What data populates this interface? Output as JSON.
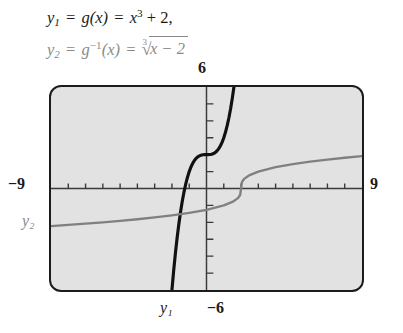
{
  "equations": {
    "line1": {
      "lhs": "y",
      "lhs_sub": "1",
      "eq1": "=",
      "fn": "g",
      "arg": "(x)",
      "eq2": "=",
      "rhs_base": "x",
      "rhs_exp": "3",
      "rhs_tail": "+ 2,",
      "plain": "y₁ = g(x) = x³ + 2,"
    },
    "line2": {
      "lhs": "y",
      "lhs_sub": "2",
      "eq1": "=",
      "fn": "g",
      "fn_exp": "−1",
      "arg": "(x)",
      "eq2": "=",
      "root_index": "3",
      "radicand": "x − 2",
      "plain": "y₂ = g⁻¹(x) = ∛(x − 2)"
    }
  },
  "screen": {
    "window_labels": {
      "ymax": "6",
      "xmin": "−9",
      "xmax": "9",
      "ymin": "−6"
    },
    "curve_labels": {
      "y1": "y₁",
      "y2": "y₂"
    },
    "colors": {
      "screen_fill": "#e2e2e2",
      "screen_border": "#1c1c1c",
      "axis": "#3a3a3a",
      "curve_y1": "#111111",
      "curve_y2": "#808080"
    }
  },
  "chart_data": {
    "type": "line",
    "title": "",
    "xlabel": "",
    "ylabel": "",
    "xlim": [
      -9,
      9
    ],
    "ylim": [
      -6,
      6
    ],
    "grid": false,
    "legend": "none",
    "axis_ticks": {
      "x": [
        -8,
        -7,
        -6,
        -5,
        -4,
        -3,
        -2,
        -1,
        1,
        2,
        3,
        4,
        5,
        6,
        7,
        8
      ],
      "y": [
        -5,
        -4,
        -3,
        -2,
        -1,
        1,
        2,
        3,
        4,
        5
      ],
      "tick_interval": 1
    },
    "annotations": [
      {
        "text": "6",
        "position": "above y-axis, top of screen"
      },
      {
        "text": "−9",
        "position": "left of screen at x-axis"
      },
      {
        "text": "9",
        "position": "right of screen at x-axis"
      },
      {
        "text": "−6",
        "position": "below y-axis, bottom of screen"
      },
      {
        "text": "y₁",
        "position": "below black curve, bottom left of center"
      },
      {
        "text": "y₂",
        "position": "left of screen, on gray curve level"
      }
    ],
    "series": [
      {
        "name": "y₁",
        "label": "y₁ = g(x) = x³ + 2",
        "expression": "x^3 + 2",
        "color": "#111111",
        "x": [
          -2.0,
          -1.9,
          -1.8,
          -1.7,
          -1.6,
          -1.5,
          -1.4,
          -1.3,
          -1.2,
          -1.1,
          -1.0,
          -0.9,
          -0.8,
          -0.7,
          -0.6,
          -0.5,
          -0.4,
          -0.3,
          -0.2,
          -0.1,
          0.0,
          0.1,
          0.2,
          0.3,
          0.4,
          0.5,
          0.6,
          0.7,
          0.8,
          0.9,
          1.0,
          1.1,
          1.2,
          1.3,
          1.4,
          1.5,
          1.587
        ],
        "y": [
          -6.0,
          -4.859,
          -3.832,
          -2.913,
          -2.096,
          -1.375,
          -0.744,
          -0.197,
          0.272,
          0.669,
          1.0,
          1.271,
          1.488,
          1.657,
          1.784,
          1.875,
          1.936,
          1.973,
          1.992,
          1.999,
          2.0,
          2.001,
          2.008,
          2.027,
          2.064,
          2.125,
          2.216,
          2.343,
          2.512,
          2.729,
          3.0,
          3.331,
          3.728,
          4.197,
          4.744,
          5.375,
          6.0
        ]
      },
      {
        "name": "y₂",
        "label": "y₂ = g⁻¹(x) = ∛(x − 2)",
        "expression": "cbrt(x - 2)",
        "color": "#808080",
        "x": [
          -9,
          -8,
          -7,
          -6,
          -5,
          -4,
          -3,
          -2,
          -1,
          0,
          1,
          1.5,
          1.8,
          1.9,
          1.95,
          2.0,
          2.05,
          2.1,
          2.2,
          2.5,
          3,
          4,
          5,
          6,
          7,
          8,
          9
        ],
        "y": [
          -2.224,
          -2.154,
          -2.08,
          -2.0,
          -1.913,
          -1.817,
          -1.71,
          -1.587,
          -1.442,
          -1.26,
          -1.0,
          -0.794,
          -0.585,
          -0.464,
          -0.368,
          0.0,
          0.368,
          0.464,
          0.585,
          0.794,
          1.0,
          1.26,
          1.442,
          1.587,
          1.71,
          1.817,
          1.913
        ]
      }
    ]
  }
}
